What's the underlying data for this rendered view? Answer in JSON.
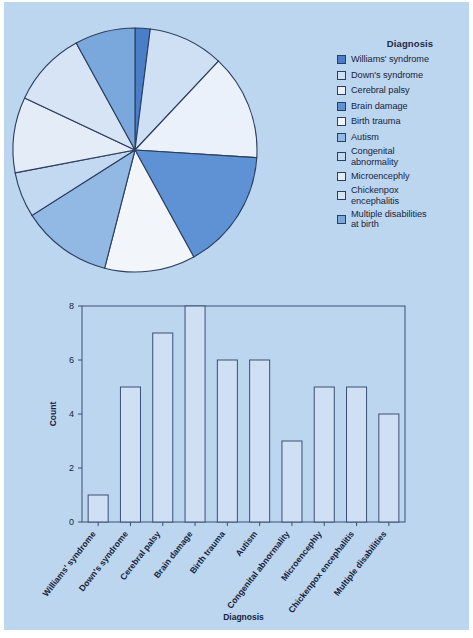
{
  "figure": {
    "background_color": "#bdd6f0",
    "page_color": "#ffffff"
  },
  "legend": {
    "title": "Diagnosis",
    "items": [
      {
        "label": "Williams' syndrome",
        "color": "#4a7ec8"
      },
      {
        "label": "Down's syndrome",
        "color": "#cfe0f4"
      },
      {
        "label": "Cerebral palsy",
        "color": "#eaf1fa"
      },
      {
        "label": "Brain damage",
        "color": "#5e92d4"
      },
      {
        "label": "Birth trauma",
        "color": "#f2f6fb"
      },
      {
        "label": "Autism",
        "color": "#92b8e4"
      },
      {
        "label": "Congenital\nabnormality",
        "color": "#c3d8f1"
      },
      {
        "label": "Microencephly",
        "color": "#e4ecf7"
      },
      {
        "label": "Chickenpox\nencephalitis",
        "color": "#d6e4f5"
      },
      {
        "label": "Multiple disabilities\nat birth",
        "color": "#7aa8dd"
      }
    ]
  },
  "chart_data": [
    {
      "type": "pie",
      "title": "",
      "legend_position": "right",
      "labels": [
        "Williams' syndrome",
        "Down's syndrome",
        "Cerebral palsy",
        "Brain damage",
        "Birth trauma",
        "Autism",
        "Congenital abnormality",
        "Microencephly",
        "Chickenpox encephalitis",
        "Multiple disabilities at birth"
      ],
      "values": [
        1,
        5,
        7,
        8,
        6,
        6,
        3,
        5,
        5,
        4
      ],
      "total": 50,
      "percentages": [
        2,
        10,
        14,
        16,
        12,
        12,
        6,
        10,
        10,
        8
      ],
      "colors": [
        "#4a7ec8",
        "#cfe0f4",
        "#eaf1fa",
        "#5e92d4",
        "#f2f6fb",
        "#92b8e4",
        "#c3d8f1",
        "#e4ecf7",
        "#d6e4f5",
        "#7aa8dd"
      ],
      "start_angle_deg": -90,
      "direction": "clockwise",
      "edge_color": "#2b3e5e"
    },
    {
      "type": "bar",
      "title": "",
      "xlabel": "Diagnosis",
      "ylabel": "Count",
      "categories": [
        "Williams' syndrome",
        "Down's syndrome",
        "Cerebral palsy",
        "Brain damage",
        "Birth trauma",
        "Autism",
        "Congenital abnormality",
        "Microencephly",
        "Chickenpox encephalitis",
        "Multiple disabilities"
      ],
      "values": [
        1,
        5,
        7,
        8,
        6,
        6,
        3,
        5,
        5,
        4
      ],
      "ylim": [
        0,
        8
      ],
      "yticks": [
        0,
        2,
        4,
        6,
        8
      ],
      "ytick_labels": [
        "0",
        "2",
        "4",
        "6",
        "8"
      ],
      "grid": false,
      "bar_fill": "#cfe0f4",
      "bar_edge": "#3a4f72",
      "xtick_rotation_deg": -52
    }
  ]
}
